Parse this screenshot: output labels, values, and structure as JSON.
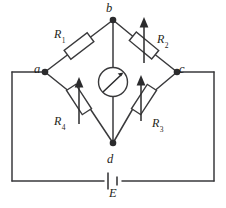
{
  "figure": {
    "background_color": "#ffffff",
    "line_color": "#3a3a3c"
  },
  "nodes": [
    {
      "id": "a",
      "label": "a",
      "x": 45,
      "y": 72,
      "role": "left-bridge-node"
    },
    {
      "id": "b",
      "label": "b",
      "x": 113,
      "y": 20,
      "role": "top-bridge-node"
    },
    {
      "id": "c",
      "label": "c",
      "x": 177,
      "y": 72,
      "role": "right-bridge-node"
    },
    {
      "id": "d",
      "label": "d",
      "x": 113,
      "y": 143,
      "role": "bottom-bridge-node"
    }
  ],
  "components": [
    {
      "id": "r1",
      "name": "R",
      "subscript": "1",
      "label": "R",
      "branch": "a-b",
      "adjustable": false,
      "type": "resistor"
    },
    {
      "id": "r2",
      "name": "R",
      "subscript": "2",
      "label": "R",
      "branch": "b-c",
      "adjustable": true,
      "type": "variable-resistor"
    },
    {
      "id": "r3",
      "name": "R",
      "subscript": "3",
      "label": "R",
      "branch": "c-d",
      "adjustable": true,
      "type": "variable-resistor"
    },
    {
      "id": "r4",
      "name": "R",
      "subscript": "4",
      "label": "R",
      "branch": "a-d",
      "adjustable": true,
      "type": "variable-resistor"
    },
    {
      "id": "galvanometer",
      "label": "",
      "branch": "b-d",
      "type": "galvanometer",
      "icon": "meter-needle-icon"
    },
    {
      "id": "source",
      "name": "E",
      "label": "E",
      "branch": "outer-bottom",
      "type": "battery",
      "icon": "battery-cell-icon"
    }
  ],
  "labels": {
    "node_a": "a",
    "node_b": "b",
    "node_c": "c",
    "node_d": "d",
    "r1": "R",
    "r1_sub": "1",
    "r2": "R",
    "r2_sub": "2",
    "r3": "R",
    "r3_sub": "3",
    "r4": "R",
    "r4_sub": "4",
    "emf": "E"
  }
}
